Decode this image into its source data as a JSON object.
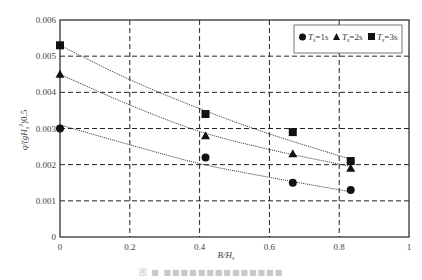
{
  "chart_data": {
    "type": "scatter",
    "title": "",
    "xlabel": "B/H_s",
    "ylabel": "q/(gH_s^3)^0.5",
    "xlim": [
      0,
      1
    ],
    "ylim": [
      0,
      0.006
    ],
    "x_ticks": [
      "0",
      "0.2",
      "0.4",
      "0.6",
      "0.8",
      "1"
    ],
    "y_ticks": [
      "0",
      "0.001",
      "0.002",
      "0.003",
      "0.004",
      "0.005",
      "0.006"
    ],
    "grid": "dashed",
    "legend_position": "top-right",
    "trendlines": "dotted fitted curve per series",
    "series": [
      {
        "name": "Ts=1s",
        "marker": "circle",
        "x": [
          0,
          0.417,
          0.667,
          0.833
        ],
        "y": [
          0.003,
          0.0022,
          0.0015,
          0.0013
        ],
        "fit": [
          [
            0,
            0.0031
          ],
          [
            0.2,
            0.00255
          ],
          [
            0.4,
            0.00203
          ],
          [
            0.6,
            0.00165
          ],
          [
            0.833,
            0.00125
          ]
        ]
      },
      {
        "name": "Ts=2s",
        "marker": "triangle",
        "x": [
          0,
          0.417,
          0.667,
          0.833
        ],
        "y": [
          0.0045,
          0.0028,
          0.0023,
          0.0019
        ],
        "fit": [
          [
            0,
            0.0045
          ],
          [
            0.2,
            0.00365
          ],
          [
            0.4,
            0.00292
          ],
          [
            0.6,
            0.00242
          ],
          [
            0.833,
            0.00195
          ]
        ]
      },
      {
        "name": "Ts=3s",
        "marker": "square",
        "x": [
          0,
          0.417,
          0.667,
          0.833
        ],
        "y": [
          0.0053,
          0.0034,
          0.0029,
          0.0021
        ],
        "fit": [
          [
            0,
            0.0053
          ],
          [
            0.2,
            0.00435
          ],
          [
            0.4,
            0.00355
          ],
          [
            0.6,
            0.00285
          ],
          [
            0.833,
            0.00215
          ]
        ]
      }
    ]
  },
  "legend": {
    "items": [
      {
        "symbol": "●",
        "prefix": "T",
        "sub": "s",
        "suffix": "=1s"
      },
      {
        "symbol": "▲",
        "prefix": "T",
        "sub": "s",
        "suffix": "=2s"
      },
      {
        "symbol": "■",
        "prefix": "T",
        "sub": "s",
        "suffix": "=3s"
      }
    ]
  },
  "axes": {
    "x_label_main": "B/H",
    "x_label_sub": "s",
    "y_label": "q/(gH",
    "y_label_sub": "s",
    "y_label_tail": "3",
    "y_label_end": ")0.5"
  },
  "caption": "图 ■ ■■■■■■■■■■■■■■"
}
